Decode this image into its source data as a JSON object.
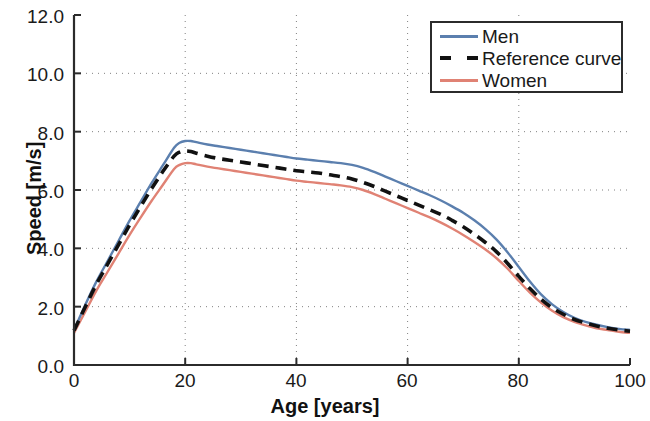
{
  "chart_data": {
    "type": "line",
    "title": "",
    "subtitle": "",
    "xlabel": "Age [years]",
    "ylabel": "Speed [m/s]",
    "xlim": [
      0,
      100
    ],
    "ylim": [
      0.0,
      12.0
    ],
    "xticks": [
      0,
      20,
      40,
      60,
      80,
      100
    ],
    "xtick_labels": [
      "0",
      "20",
      "40",
      "60",
      "80",
      "100"
    ],
    "yticks": [
      0.0,
      2.0,
      4.0,
      6.0,
      8.0,
      10.0,
      12.0
    ],
    "ytick_labels": [
      "0.0",
      "2.0",
      "4.0",
      "6.0",
      "8.0",
      "10.0",
      "12.0"
    ],
    "grid": true,
    "grid_style": "dotted",
    "legend_position": "top-right",
    "legend_entries": [
      "Men",
      "Reference curve",
      "Women"
    ],
    "x": [
      0,
      2,
      4,
      6,
      8,
      10,
      12,
      14,
      16,
      18,
      19,
      20,
      21,
      22,
      24,
      26,
      28,
      30,
      32,
      34,
      36,
      38,
      40,
      42,
      44,
      46,
      48,
      50,
      52,
      54,
      56,
      58,
      60,
      62,
      64,
      66,
      68,
      70,
      72,
      74,
      76,
      78,
      80,
      82,
      84,
      86,
      88,
      90,
      92,
      94,
      96,
      98,
      100
    ],
    "series": [
      {
        "name": "Men",
        "color": "#5b7fae",
        "style": "solid",
        "values": [
          1.2,
          2.05,
          2.85,
          3.55,
          4.25,
          4.95,
          5.6,
          6.25,
          6.85,
          7.45,
          7.62,
          7.68,
          7.68,
          7.64,
          7.56,
          7.5,
          7.44,
          7.38,
          7.32,
          7.26,
          7.2,
          7.14,
          7.08,
          7.04,
          7.0,
          6.96,
          6.92,
          6.86,
          6.76,
          6.62,
          6.46,
          6.3,
          6.14,
          5.98,
          5.82,
          5.64,
          5.44,
          5.22,
          4.96,
          4.66,
          4.3,
          3.86,
          3.36,
          2.86,
          2.42,
          2.08,
          1.82,
          1.62,
          1.48,
          1.38,
          1.3,
          1.24,
          1.2
        ]
      },
      {
        "name": "Reference curve",
        "color": "#111111",
        "style": "dashed",
        "values": [
          1.18,
          1.98,
          2.76,
          3.44,
          4.12,
          4.8,
          5.44,
          6.06,
          6.64,
          7.16,
          7.3,
          7.34,
          7.32,
          7.26,
          7.16,
          7.08,
          7.02,
          6.96,
          6.9,
          6.84,
          6.78,
          6.72,
          6.66,
          6.62,
          6.58,
          6.52,
          6.46,
          6.38,
          6.26,
          6.12,
          5.96,
          5.8,
          5.64,
          5.48,
          5.32,
          5.16,
          4.96,
          4.74,
          4.48,
          4.2,
          3.88,
          3.48,
          3.04,
          2.62,
          2.26,
          1.96,
          1.74,
          1.56,
          1.44,
          1.34,
          1.26,
          1.2,
          1.16
        ]
      },
      {
        "name": "Women",
        "color": "#e08274",
        "style": "solid",
        "values": [
          1.1,
          1.82,
          2.54,
          3.18,
          3.82,
          4.46,
          5.06,
          5.64,
          6.18,
          6.72,
          6.86,
          6.92,
          6.92,
          6.88,
          6.8,
          6.74,
          6.68,
          6.62,
          6.56,
          6.5,
          6.44,
          6.38,
          6.32,
          6.28,
          6.24,
          6.2,
          6.16,
          6.1,
          6.0,
          5.86,
          5.7,
          5.54,
          5.38,
          5.22,
          5.06,
          4.88,
          4.68,
          4.46,
          4.22,
          3.96,
          3.66,
          3.3,
          2.88,
          2.48,
          2.14,
          1.86,
          1.64,
          1.48,
          1.36,
          1.26,
          1.2,
          1.14,
          1.1
        ]
      }
    ]
  },
  "axes": {
    "x_title": "Age [years]",
    "y_title": "Speed [m/s]",
    "x_ticks": [
      "0",
      "20",
      "40",
      "60",
      "80",
      "100"
    ],
    "y_ticks": [
      "12.0",
      "10.0",
      "8.0",
      "6.0",
      "4.0",
      "2.0",
      "0.0"
    ]
  },
  "legend": {
    "items": [
      {
        "label": "Men",
        "color": "#5b7fae",
        "style": "solid"
      },
      {
        "label": "Reference curve",
        "color": "#111111",
        "style": "dashed"
      },
      {
        "label": "Women",
        "color": "#e08274",
        "style": "solid"
      }
    ]
  },
  "colors": {
    "men": "#5b7fae",
    "women": "#e08274",
    "reference": "#111111",
    "axis": "#2b2b2b",
    "grid": "#808080"
  }
}
